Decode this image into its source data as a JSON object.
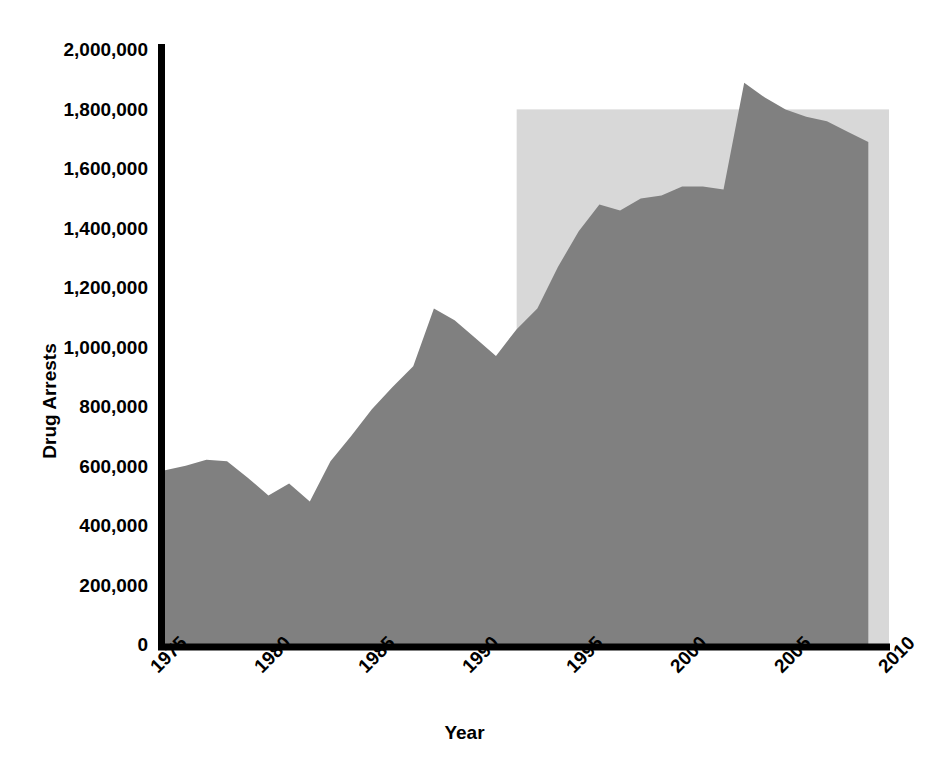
{
  "chart_data": {
    "type": "area",
    "title": "",
    "xlabel": "Year",
    "ylabel": "Drug Arrests",
    "xlim": [
      1975,
      2010
    ],
    "ylim": [
      0,
      2000000
    ],
    "grid": false,
    "legend": "none",
    "x_ticks": [
      "1975",
      "1980",
      "1985",
      "1990",
      "1995",
      "2000",
      "2005",
      "2010"
    ],
    "x_tick_values": [
      1975,
      1980,
      1985,
      1990,
      1995,
      2000,
      2005,
      2010
    ],
    "y_ticks": [
      "0",
      "200,000",
      "400,000",
      "600,000",
      "800,000",
      "1,000,000",
      "1,200,000",
      "1,400,000",
      "1,600,000",
      "1,800,000",
      "2,000,000"
    ],
    "y_tick_values": [
      0,
      200000,
      400000,
      600000,
      800000,
      1000000,
      1200000,
      1400000,
      1600000,
      1800000,
      2000000
    ],
    "series": [
      {
        "name": "Drug Arrests",
        "color": "#808080",
        "x": [
          1975,
          1976,
          1977,
          1978,
          1979,
          1980,
          1981,
          1982,
          1983,
          1984,
          1985,
          1986,
          1987,
          1988,
          1989,
          1990,
          1991,
          1992,
          1993,
          1994,
          1995,
          1996,
          1997,
          1998,
          1999,
          2000,
          2001,
          2002,
          2003,
          2004,
          2005,
          2006,
          2007,
          2008,
          2009
        ],
        "values": [
          585000,
          600000,
          620000,
          615000,
          560000,
          500000,
          540000,
          480000,
          615000,
          700000,
          790000,
          865000,
          935000,
          1130000,
          1090000,
          1030000,
          970000,
          1060000,
          1130000,
          1270000,
          1390000,
          1480000,
          1460000,
          1500000,
          1510000,
          1540000,
          1540000,
          1530000,
          1890000,
          1840000,
          1800000,
          1775000,
          1760000,
          1725000,
          1690000
        ]
      }
    ],
    "highlight_region": {
      "name": "shaded-region",
      "color": "#d8d8d8",
      "x_start": 1992,
      "x_end": 2010,
      "y_top": 1800000,
      "y_bottom": 0
    }
  },
  "axis": {
    "axis_color": "#000000",
    "background": "#ffffff"
  }
}
